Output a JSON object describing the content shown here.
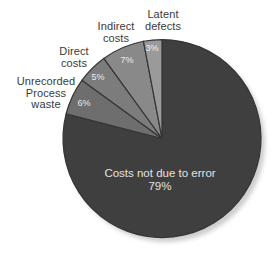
{
  "chart_data": {
    "type": "pie",
    "direction": "clockwise",
    "start_angle_deg": 0,
    "legend": "none",
    "background": "#ffffff",
    "slices": [
      {
        "label": "Costs not due to error",
        "value": 79,
        "pct_label": "79%",
        "color": "#3f3f3f",
        "label_position": "inside"
      },
      {
        "label": "Unrecorded Process waste",
        "value": 6,
        "pct_label": "6%",
        "color": "#6e6e6e",
        "label_position": "outside"
      },
      {
        "label": "Direct costs",
        "value": 5,
        "pct_label": "5%",
        "color": "#7c7c7c",
        "label_position": "outside"
      },
      {
        "label": "Indirect costs",
        "value": 7,
        "pct_label": "7%",
        "color": "#898989",
        "label_position": "outside"
      },
      {
        "label": "Latent defects",
        "value": 3,
        "pct_label": "3%",
        "color": "#9a9a9a",
        "label_position": "outside"
      }
    ],
    "slice_border_color": "#363636",
    "shadow_color": "#cdcdcd"
  },
  "callouts": [
    {
      "name": "latent-defects",
      "lines": [
        "Latent",
        "defects"
      ]
    },
    {
      "name": "indirect-costs",
      "lines": [
        "Indirect",
        "costs"
      ]
    },
    {
      "name": "direct-costs",
      "lines": [
        "Direct",
        "costs"
      ]
    },
    {
      "name": "unrecorded-process-waste",
      "lines": [
        "Unrecorded",
        "Process",
        "waste"
      ]
    }
  ]
}
